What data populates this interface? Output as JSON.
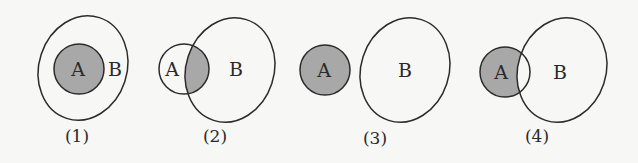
{
  "figure": {
    "colors": {
      "shade": "#a8a8a8",
      "stroke": "#2b2b2b",
      "background": "#f7f7f5"
    },
    "diagrams": [
      {
        "caption": "(1)",
        "set_a_label": "A",
        "set_b_label": "B",
        "relation": "A subset of B",
        "shaded": "A"
      },
      {
        "caption": "(2)",
        "set_a_label": "A",
        "set_b_label": "B",
        "relation": "A and B overlap",
        "shaded": "A ∩ B"
      },
      {
        "caption": "(3)",
        "set_a_label": "A",
        "set_b_label": "B",
        "relation": "A and B disjoint",
        "shaded": "A"
      },
      {
        "caption": "(4)",
        "set_a_label": "A",
        "set_b_label": "B",
        "relation": "A and B overlap",
        "shaded": "A − B"
      }
    ]
  }
}
